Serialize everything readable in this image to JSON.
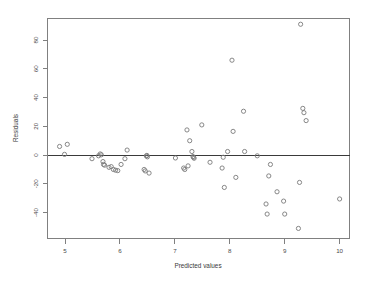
{
  "chart_data": {
    "type": "scatter",
    "title": "",
    "xlabel": "Predicted values",
    "ylabel": "Residuals",
    "xlim": [
      4.68,
      10.18
    ],
    "ylim": [
      -58,
      95
    ],
    "grid": false,
    "legend": null,
    "xticks": [
      5,
      6,
      7,
      8,
      9,
      10
    ],
    "xticklabels": [
      "5",
      "6",
      "7",
      "8",
      "9",
      "10"
    ],
    "yticks": [
      -40,
      -20,
      0,
      20,
      40,
      60,
      80
    ],
    "yticklabels": [
      "-40",
      "-20",
      "0",
      "20",
      "40",
      "60",
      "80"
    ],
    "reference_lines": [
      {
        "orientation": "horizontal",
        "y": 0,
        "color": "#3a3a3a"
      }
    ],
    "marker": "open-circle",
    "marker_color": "#7a7a7a",
    "points": [
      {
        "x": 4.9,
        "y": 6.0
      },
      {
        "x": 4.99,
        "y": 0.5
      },
      {
        "x": 5.04,
        "y": 7.5
      },
      {
        "x": 5.49,
        "y": -2.5
      },
      {
        "x": 5.61,
        "y": -0.5
      },
      {
        "x": 5.64,
        "y": 0.8
      },
      {
        "x": 5.66,
        "y": 0.2
      },
      {
        "x": 5.69,
        "y": -4.5
      },
      {
        "x": 5.7,
        "y": -6.5
      },
      {
        "x": 5.72,
        "y": -7.0
      },
      {
        "x": 5.8,
        "y": -8.5
      },
      {
        "x": 5.84,
        "y": -8.0
      },
      {
        "x": 5.88,
        "y": -10.0
      },
      {
        "x": 5.92,
        "y": -10.5
      },
      {
        "x": 5.96,
        "y": -10.8
      },
      {
        "x": 6.02,
        "y": -6.5
      },
      {
        "x": 6.09,
        "y": -2.5
      },
      {
        "x": 6.13,
        "y": 3.5
      },
      {
        "x": 6.44,
        "y": -10.0
      },
      {
        "x": 6.46,
        "y": -11.0
      },
      {
        "x": 6.48,
        "y": -0.6
      },
      {
        "x": 6.49,
        "y": -0.2
      },
      {
        "x": 6.5,
        "y": -1.2
      },
      {
        "x": 6.53,
        "y": -12.5
      },
      {
        "x": 7.01,
        "y": -2.0
      },
      {
        "x": 7.16,
        "y": -9.0
      },
      {
        "x": 7.18,
        "y": -10.0
      },
      {
        "x": 7.22,
        "y": 17.5
      },
      {
        "x": 7.24,
        "y": -7.5
      },
      {
        "x": 7.27,
        "y": 10.0
      },
      {
        "x": 7.31,
        "y": 2.5
      },
      {
        "x": 7.33,
        "y": -1.0
      },
      {
        "x": 7.34,
        "y": -1.6
      },
      {
        "x": 7.35,
        "y": -2.2
      },
      {
        "x": 7.49,
        "y": 21.0
      },
      {
        "x": 7.64,
        "y": -5.0
      },
      {
        "x": 7.86,
        "y": -9.0
      },
      {
        "x": 7.88,
        "y": -1.5
      },
      {
        "x": 7.9,
        "y": -22.5
      },
      {
        "x": 7.96,
        "y": 2.5
      },
      {
        "x": 8.04,
        "y": 66.0
      },
      {
        "x": 8.06,
        "y": 16.5
      },
      {
        "x": 8.11,
        "y": -15.5
      },
      {
        "x": 8.25,
        "y": 30.5
      },
      {
        "x": 8.27,
        "y": 2.5
      },
      {
        "x": 8.5,
        "y": -0.5
      },
      {
        "x": 8.66,
        "y": -34.0
      },
      {
        "x": 8.68,
        "y": -41.0
      },
      {
        "x": 8.71,
        "y": -14.5
      },
      {
        "x": 8.74,
        "y": -6.5
      },
      {
        "x": 8.86,
        "y": -25.5
      },
      {
        "x": 8.98,
        "y": -32.0
      },
      {
        "x": 9.0,
        "y": -41.0
      },
      {
        "x": 9.25,
        "y": -51.0
      },
      {
        "x": 9.27,
        "y": -19.0
      },
      {
        "x": 9.29,
        "y": 91.0
      },
      {
        "x": 9.33,
        "y": 32.5
      },
      {
        "x": 9.35,
        "y": 29.5
      },
      {
        "x": 9.39,
        "y": 24.0
      },
      {
        "x": 10.0,
        "y": -30.5
      }
    ]
  },
  "plot": {
    "xaxis_title": "Predicted values",
    "yaxis_title": "Residuals"
  }
}
